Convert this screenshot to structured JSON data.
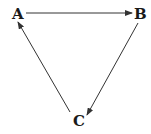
{
  "diagram": {
    "nodes": [
      {
        "id": "A",
        "label": "A"
      },
      {
        "id": "B",
        "label": "B"
      },
      {
        "id": "C",
        "label": "C"
      }
    ],
    "edges": [
      {
        "from": "A",
        "to": "B"
      },
      {
        "from": "B",
        "to": "C"
      },
      {
        "from": "C",
        "to": "A"
      }
    ],
    "colors": {
      "stroke": "#333333",
      "text": "#1a1a1a",
      "background": "#ffffff"
    }
  }
}
